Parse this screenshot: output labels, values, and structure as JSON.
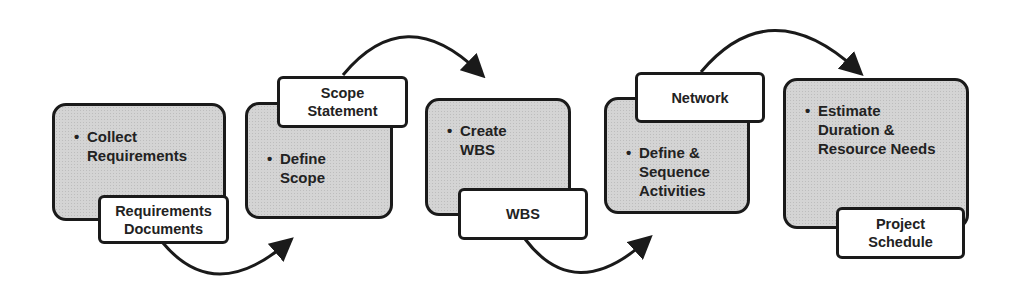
{
  "diagram": {
    "steps": [
      {
        "id": "collect-requirements",
        "bullet": "•",
        "text": "Collect Requirements",
        "output": "Requirements Documents"
      },
      {
        "id": "define-scope",
        "bullet": "•",
        "text": "Define Scope",
        "output": "Scope Statement"
      },
      {
        "id": "create-wbs",
        "bullet": "•",
        "text": "Create WBS",
        "output": "WBS"
      },
      {
        "id": "define-sequence-activities",
        "bullet": "•",
        "text": "Define & Sequence Activities",
        "output": "Network"
      },
      {
        "id": "estimate-duration-resources",
        "bullet": "•",
        "text": "Estimate Duration & Resource Needs",
        "output": "Project Schedule"
      }
    ],
    "lines": {
      "s1": [
        "Collect",
        "Requirements"
      ],
      "s2": [
        "Define",
        "Scope"
      ],
      "s3": [
        "Create",
        "WBS"
      ],
      "s4": [
        "Define &",
        "Sequence",
        "Activities"
      ],
      "s5": [
        "Estimate",
        "Duration &",
        "Resource Needs"
      ],
      "o1": [
        "Requirements",
        "Documents"
      ],
      "o2": [
        "Scope",
        "Statement"
      ],
      "o3": [
        "WBS"
      ],
      "o4": [
        "Network"
      ],
      "o5": [
        "Project",
        "Schedule"
      ]
    },
    "colors": {
      "box_fill": "#d4d4d4",
      "border": "#1a1a1a",
      "label_fill": "#ffffff",
      "text": "#222222"
    }
  }
}
